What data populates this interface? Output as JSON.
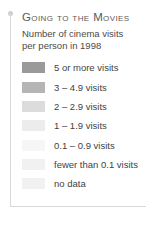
{
  "legend": {
    "title": "Going to the Movies",
    "subtitle_lines": [
      "Number of cinema visits",
      "per person in 1998"
    ],
    "frame_color": "#d8d8d8",
    "pin_color": "#cfcfcf",
    "title_color": "#5a5a5a",
    "label_color": "#3f3f3f",
    "rows": [
      {
        "label": "5 or more visits",
        "color": "#9a9a9a"
      },
      {
        "label": "3 – 4.9 visits",
        "color": "#b5b5b5"
      },
      {
        "label": "2 – 2.9 visits",
        "color": "#dcdcdc"
      },
      {
        "label": "1 – 1.9 visits",
        "color": "#ececec"
      },
      {
        "label": "0.1 – 0.9 visits",
        "color": "#f6f6f6"
      },
      {
        "label": "fewer than 0.1 visits",
        "color": "#f1f1f1"
      },
      {
        "label": "no data",
        "color": "#f1f1f1"
      }
    ]
  },
  "chart_data": {
    "type": "table",
    "title": "Going to the Movies",
    "subtitle": "Number of cinema visits per person in 1998",
    "legend_position": "standalone",
    "categories": [
      "5 or more visits",
      "3 – 4.9 visits",
      "2 – 2.9 visits",
      "1 – 1.9 visits",
      "0.1 – 0.9 visits",
      "fewer than 0.1 visits",
      "no data"
    ],
    "bin_ranges": [
      [
        5,
        null
      ],
      [
        3,
        4.9
      ],
      [
        2,
        2.9
      ],
      [
        1,
        1.9
      ],
      [
        0.1,
        0.9
      ],
      [
        0,
        0.1
      ],
      [
        null,
        null
      ]
    ],
    "colors": [
      "#9a9a9a",
      "#b5b5b5",
      "#dcdcdc",
      "#ececec",
      "#f6f6f6",
      "#f1f1f1",
      "#f1f1f1"
    ],
    "xlabel": "",
    "ylabel": "cinema visits per person",
    "year": 1998
  }
}
